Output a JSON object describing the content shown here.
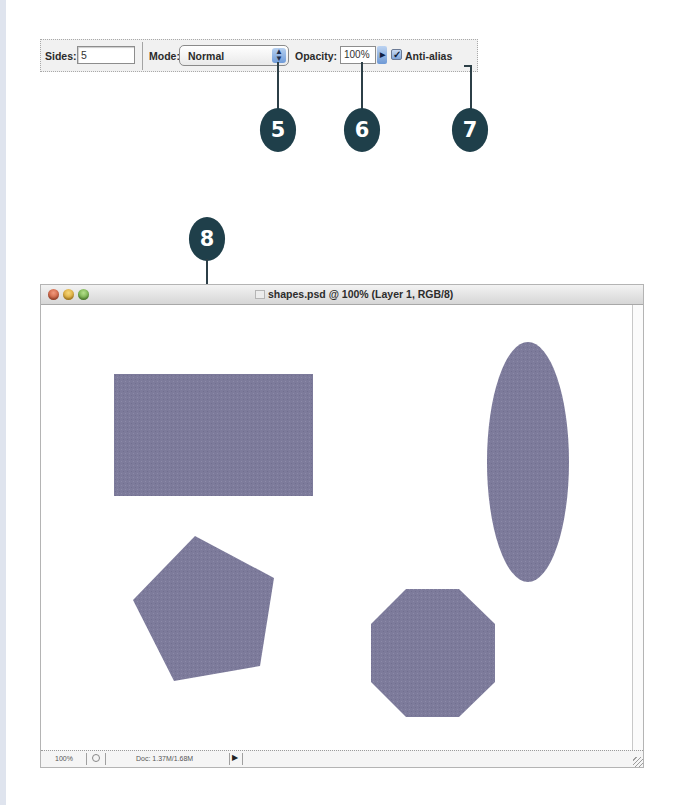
{
  "toolbar": {
    "sides_label": "Sides:",
    "sides_value": "5",
    "mode_label": "Mode:",
    "mode_value": "Normal",
    "opacity_label": "Opacity:",
    "opacity_value": "100%",
    "anti_alias_label": "Anti-alias",
    "anti_alias_checked": true
  },
  "callouts": [
    {
      "number": "5",
      "target": "mode-select"
    },
    {
      "number": "6",
      "target": "opacity-field"
    },
    {
      "number": "7",
      "target": "anti-alias-checkbox"
    },
    {
      "number": "8",
      "target": "rectangle-shape"
    }
  ],
  "document_window": {
    "title": "shapes.psd @ 100% (Layer 1, RGB/8)",
    "status_bar": {
      "zoom": "100%",
      "doc_size": "Doc: 1.37M/1.68M"
    },
    "shapes": [
      {
        "type": "rectangle",
        "color": "#7d7b9b"
      },
      {
        "type": "ellipse",
        "color": "#7d7b9b"
      },
      {
        "type": "pentagon",
        "color": "#7d7b9b"
      },
      {
        "type": "octagon",
        "color": "#7d7b9b"
      }
    ]
  },
  "colors": {
    "shape_fill": "#7d7b9b",
    "callout_fill": "#1f3f4a"
  }
}
